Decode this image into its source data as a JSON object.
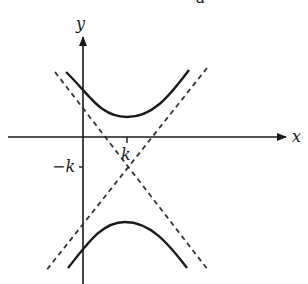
{
  "diagram": {
    "type": "hyperbola-with-asymptotes",
    "labels": {
      "x_axis": "x",
      "y_axis": "y",
      "x_tick": "k",
      "y_tick": "−k",
      "top_fragment": "a"
    },
    "center": {
      "x": "k",
      "y": "−k"
    },
    "colors": {
      "stroke": "#1a1a1a",
      "background": "#ffffff"
    },
    "branches": [
      "upper",
      "lower"
    ],
    "asymptotes": 2
  }
}
